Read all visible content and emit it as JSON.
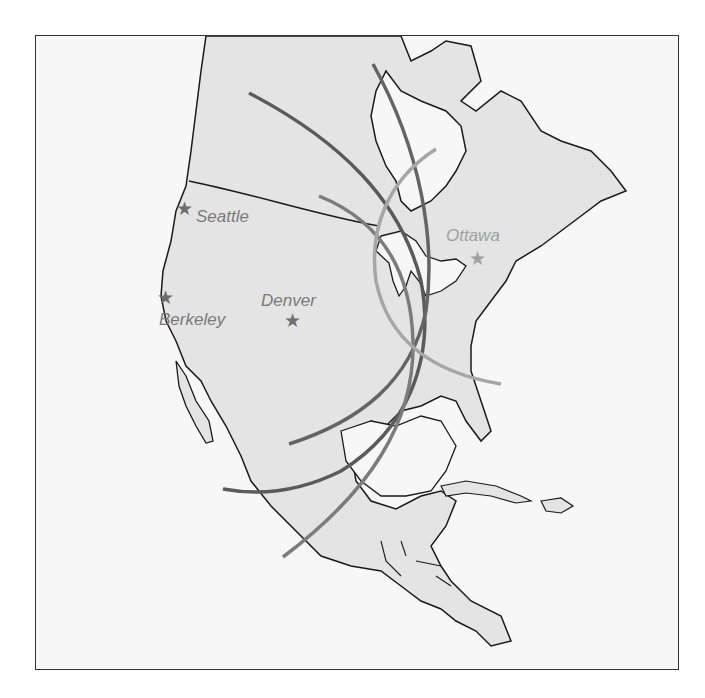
{
  "map": {
    "region": "North America",
    "colors": {
      "land": "#e4e4e4",
      "water": "#f7f7f7",
      "coastline": "#1a1a1a",
      "arc_dark": "#5a5a5a",
      "arc_mid": "#7c7c7c",
      "arc_light": "#a6a6a6",
      "label": "#7a7a7a",
      "label_ottawa": "#a0a0a0"
    },
    "cities": [
      {
        "name": "Seattle",
        "marker": "star-icon"
      },
      {
        "name": "Berkeley",
        "marker": "star-icon"
      },
      {
        "name": "Denver",
        "marker": "star-icon"
      },
      {
        "name": "Ottawa",
        "marker": "star-icon"
      }
    ],
    "star_glyph": "★"
  }
}
